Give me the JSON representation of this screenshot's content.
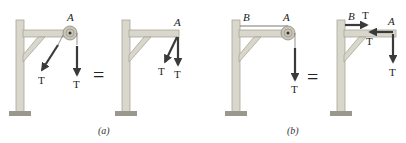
{
  "figure": {
    "panels": [
      {
        "id": "a",
        "caption": "(a)",
        "left": {
          "point_label": "A",
          "forces": [
            {
              "label": "T",
              "direction": "down-left diagonal"
            },
            {
              "label": "T",
              "direction": "down"
            }
          ],
          "has_pulley": true
        },
        "operator": "=",
        "right": {
          "point_label": "A",
          "forces": [
            {
              "label": "T",
              "direction": "down-left diagonal"
            },
            {
              "label": "T",
              "direction": "down"
            }
          ],
          "has_pulley": false
        }
      },
      {
        "id": "b",
        "caption": "(b)",
        "left": {
          "point_labels": [
            "B",
            "A"
          ],
          "forces": [
            {
              "label": "T",
              "direction": "down"
            }
          ],
          "has_pulley": true,
          "has_cable_b_to_a": true
        },
        "operator": "=",
        "right": {
          "point_labels": [
            "B",
            "A"
          ],
          "forces": [
            {
              "label": "T",
              "direction": "right",
              "at": "B"
            },
            {
              "label": "T",
              "direction": "left",
              "at": "A"
            },
            {
              "label": "T",
              "direction": "down",
              "at": "A"
            }
          ],
          "has_pulley": false
        }
      }
    ],
    "colors": {
      "wood": "#d9d6cc",
      "wood_edge": "#a9a598",
      "base": "#9a978c",
      "arrow": "#3a3a3a",
      "pulley": "#c9c5b8",
      "text": "#222222"
    }
  }
}
